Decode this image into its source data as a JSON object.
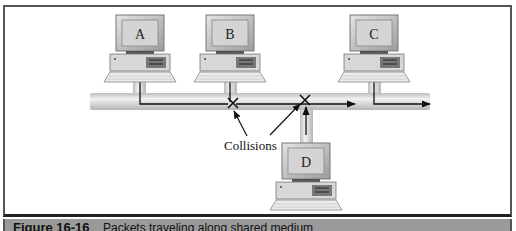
{
  "figure": {
    "number": "Figure 16-16",
    "caption": "Packets traveling along shared medium"
  },
  "diagram": {
    "computers": [
      {
        "label": "A",
        "position": "top"
      },
      {
        "label": "B",
        "position": "top"
      },
      {
        "label": "C",
        "position": "top"
      },
      {
        "label": "D",
        "position": "bottom"
      }
    ],
    "annotation": "Collisions",
    "colors": {
      "pipe": "#d0d0d0",
      "pipe_edge": "#a8a8a8",
      "frame": "#555555",
      "caption_band": "#9a9a9a",
      "arrow": "#111111"
    }
  }
}
